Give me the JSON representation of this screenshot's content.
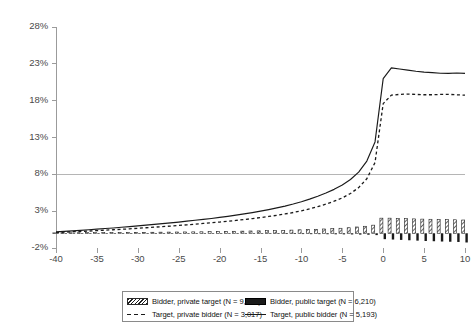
{
  "chart_data": {
    "type": "bar",
    "title": "",
    "subtitle": "",
    "xlabel": "",
    "ylabel": "",
    "xlim": [
      -40,
      10
    ],
    "ylim": [
      -2,
      28
    ],
    "grid": false,
    "legend_position": "bottom",
    "y_ticks": [
      "-2%",
      "3%",
      "8%",
      "13%",
      "18%",
      "23%",
      "28%"
    ],
    "y_tick_values": [
      -2,
      3,
      8,
      13,
      18,
      23,
      28
    ],
    "x_ticks": [
      "-40",
      "-35",
      "-30",
      "-25",
      "-20",
      "-15",
      "-10",
      "-5",
      "0",
      "5",
      "10"
    ],
    "x_tick_values": [
      -40,
      -35,
      -30,
      -25,
      -20,
      -15,
      -10,
      -5,
      0,
      5,
      10
    ],
    "x": [
      -40,
      -39,
      -38,
      -37,
      -36,
      -35,
      -34,
      -33,
      -32,
      -31,
      -30,
      -29,
      -28,
      -27,
      -26,
      -25,
      -24,
      -23,
      -22,
      -21,
      -20,
      -19,
      -18,
      -17,
      -16,
      -15,
      -14,
      -13,
      -12,
      -11,
      -10,
      -9,
      -8,
      -7,
      -6,
      -5,
      -4,
      -3,
      -2,
      -1,
      0,
      1,
      2,
      3,
      4,
      5,
      6,
      7,
      8,
      9,
      10
    ],
    "series": [
      {
        "name": "Bidder, private target (N = 9,480)",
        "label": "Bidder, private target",
        "n": "9,480",
        "style": "bar-hatched",
        "color": "#1f1f1f",
        "values": [
          0.05,
          0.05,
          0.06,
          0.07,
          0.08,
          0.08,
          0.09,
          0.1,
          0.11,
          0.12,
          0.13,
          0.13,
          0.14,
          0.15,
          0.16,
          0.17,
          0.18,
          0.19,
          0.2,
          0.22,
          0.24,
          0.25,
          0.27,
          0.29,
          0.31,
          0.33,
          0.35,
          0.37,
          0.4,
          0.43,
          0.47,
          0.5,
          0.54,
          0.58,
          0.63,
          0.68,
          0.75,
          0.85,
          0.95,
          1.1,
          2.05,
          2.05,
          2.0,
          1.98,
          1.95,
          1.92,
          1.9,
          1.88,
          1.85,
          1.83,
          1.8
        ]
      },
      {
        "name": "Bidder, public target (N = 6,210)",
        "label": "Bidder, public target",
        "n": "6,210",
        "style": "bar-solid",
        "color": "#1a1a1a",
        "values": [
          0.02,
          0.02,
          0.02,
          0.02,
          0.02,
          0.01,
          0.01,
          0.01,
          0.0,
          0.0,
          0.0,
          -0.01,
          -0.01,
          -0.02,
          -0.02,
          -0.03,
          -0.03,
          -0.04,
          -0.04,
          -0.05,
          -0.05,
          -0.06,
          -0.06,
          -0.07,
          -0.07,
          -0.08,
          -0.08,
          -0.09,
          -0.1,
          -0.1,
          -0.11,
          -0.12,
          -0.12,
          -0.13,
          -0.14,
          -0.15,
          -0.16,
          -0.18,
          -0.2,
          -0.25,
          -0.8,
          -0.85,
          -0.9,
          -0.95,
          -1.0,
          -1.05,
          -1.08,
          -1.12,
          -1.15,
          -1.18,
          -1.25
        ]
      },
      {
        "name": "Target, private bidder (N = 3,017)",
        "label": "Target, private bidder",
        "n": "3,017",
        "style": "line-dashed",
        "color": "#1a1a1a",
        "values": [
          0.1,
          0.15,
          0.2,
          0.25,
          0.3,
          0.36,
          0.42,
          0.48,
          0.54,
          0.6,
          0.68,
          0.75,
          0.83,
          0.9,
          0.98,
          1.06,
          1.15,
          1.24,
          1.33,
          1.42,
          1.52,
          1.63,
          1.74,
          1.86,
          1.99,
          2.13,
          2.28,
          2.44,
          2.62,
          2.82,
          3.05,
          3.32,
          3.62,
          3.96,
          4.35,
          4.8,
          5.4,
          6.2,
          7.4,
          9.6,
          17.6,
          18.75,
          18.85,
          18.9,
          18.85,
          18.8,
          18.8,
          18.85,
          18.85,
          18.8,
          18.75
        ]
      },
      {
        "name": "Target, public bidder (N = 5,193)",
        "label": "Target, public bidder",
        "n": "5,193",
        "style": "line-solid",
        "color": "#1a1a1a",
        "values": [
          0.18,
          0.25,
          0.32,
          0.4,
          0.48,
          0.56,
          0.64,
          0.72,
          0.81,
          0.9,
          1.0,
          1.1,
          1.2,
          1.3,
          1.41,
          1.52,
          1.64,
          1.76,
          1.88,
          2.01,
          2.15,
          2.3,
          2.46,
          2.63,
          2.81,
          3.0,
          3.21,
          3.44,
          3.69,
          3.97,
          4.28,
          4.63,
          5.02,
          5.46,
          5.96,
          6.55,
          7.3,
          8.3,
          9.8,
          12.4,
          21.0,
          22.45,
          22.3,
          22.15,
          22.0,
          21.88,
          21.8,
          21.72,
          21.7,
          21.75,
          21.7
        ]
      }
    ]
  },
  "legend": {
    "items": [
      {
        "swatch": "hatched-bar-swatch",
        "label": "Bidder, private target (N = 9,480)"
      },
      {
        "swatch": "solid-bar-swatch",
        "label": "Bidder, public target (N = 6,210)"
      },
      {
        "swatch": "dashed-line-swatch",
        "label": "Target, private bidder (N = 3,017)"
      },
      {
        "swatch": "solid-line-swatch",
        "label": "Target, public bidder (N = 5,193)"
      }
    ]
  }
}
